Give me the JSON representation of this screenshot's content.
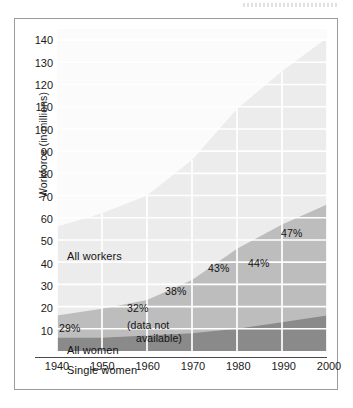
{
  "figure": {
    "y_axis_title": "Workforce (in millions)"
  },
  "chart_data": {
    "type": "area",
    "title": "",
    "xlabel": "",
    "ylabel": "Workforce (in millions)",
    "xlim": [
      1940,
      2000
    ],
    "ylim": [
      0,
      145
    ],
    "ytick_labels": [
      "140",
      "130",
      "120",
      "110",
      "100",
      "90",
      "80",
      "70",
      "60",
      "50",
      "40",
      "30",
      "20",
      "10"
    ],
    "yticks": [
      140,
      130,
      120,
      110,
      100,
      90,
      80,
      70,
      60,
      50,
      40,
      30,
      20,
      10
    ],
    "xtick_labels": [
      "1940",
      "1950",
      "1960",
      "1970",
      "1980",
      "1990",
      "2000"
    ],
    "x": [
      1940,
      1950,
      1960,
      1970,
      1980,
      1990,
      2000
    ],
    "grid": true,
    "grid_color": "#ffffff",
    "legend": "in-plot labels",
    "stacked": true,
    "series": [
      {
        "name": "All workers",
        "color": "#ececec",
        "values": [
          56,
          62,
          70,
          86,
          109,
          126,
          141
        ]
      },
      {
        "name": "All women",
        "color": "#bdbdbd",
        "values": [
          16,
          19,
          23,
          32,
          46,
          57,
          66
        ]
      },
      {
        "name": "Single women",
        "color": "#8a8a8a",
        "values": [
          6,
          6,
          7,
          8,
          10,
          13,
          16
        ]
      }
    ],
    "annotations": [
      {
        "text": "All workers",
        "x": 1940,
        "y": 54,
        "kind": "series-label"
      },
      {
        "text": "All women",
        "x": 1940,
        "y": 11,
        "kind": "series-label"
      },
      {
        "text": "Single women",
        "x": 1940,
        "y": 4,
        "kind": "series-label"
      },
      {
        "text": "29%",
        "x": 1940,
        "y": 20,
        "kind": "percent"
      },
      {
        "text": "32%",
        "x": 1960,
        "y": 28,
        "kind": "percent"
      },
      {
        "text": "38%",
        "x": 1970,
        "y": 34,
        "kind": "percent"
      },
      {
        "text": "43%",
        "x": 1980,
        "y": 43,
        "kind": "percent"
      },
      {
        "text": "44%",
        "x": 1990,
        "y": 47,
        "kind": "percent"
      },
      {
        "text": "47%",
        "x": 2000,
        "y": 58,
        "kind": "percent"
      },
      {
        "text": "(data not",
        "x": 1955,
        "y": 20,
        "kind": "note"
      },
      {
        "text": "available)",
        "x": 1958,
        "y": 15,
        "kind": "note"
      }
    ]
  },
  "annotations": {
    "all_workers": "All workers",
    "all_women": "All women",
    "single_women": "Single women",
    "pct_1940": "29%",
    "pct_1960": "32%",
    "pct_1970": "38%",
    "pct_1980": "43%",
    "pct_1990": "44%",
    "pct_2000": "47%",
    "note_line1": "(data not",
    "note_line2": "available)"
  },
  "y_ticks": [
    "140",
    "130",
    "120",
    "110",
    "100",
    "90",
    "80",
    "70",
    "60",
    "50",
    "40",
    "30",
    "20",
    "10"
  ],
  "x_ticks": [
    "1940",
    "1950",
    "1960",
    "1970",
    "1980",
    "1990",
    "2000"
  ],
  "colors": {
    "all_workers": "#ececec",
    "all_women": "#bdbdbd",
    "single_women": "#8a8a8a",
    "gridline": "#ffffff",
    "frame": "#9a9a9a",
    "text": "#141414"
  }
}
